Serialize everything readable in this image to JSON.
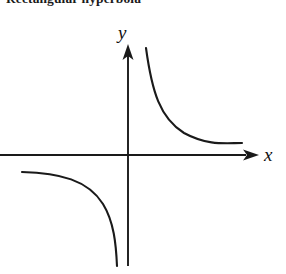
{
  "figure": {
    "caption": "Rectangular hyperbola",
    "background_color": "#ffffff",
    "stroke_color": "#1a1a1a",
    "width": 286,
    "height": 274
  },
  "axes": {
    "x_axis": {
      "label": "x",
      "label_style": "italic-serif",
      "origin_x": 128,
      "y": 155,
      "start_x": 0,
      "end_x": 258,
      "arrowhead": "right",
      "arrow_icon": "arrowhead-right-icon"
    },
    "y_axis": {
      "label": "y",
      "label_style": "italic-serif",
      "x": 128,
      "top_y": 45,
      "bottom_y": 266,
      "arrowhead": "up",
      "arrow_icon": "arrowhead-up-icon"
    }
  },
  "chart_data": {
    "type": "line",
    "title": "Rectangular hyperbola",
    "xlabel": "x",
    "ylabel": "y",
    "grid": false,
    "legend": "none",
    "equation": "y = k / x",
    "asymptotes": [
      "x = 0",
      "y = 0"
    ],
    "series": [
      {
        "name": "branch-quadrant-I",
        "quadrant": "I",
        "description": "Upper-right branch approaching the y-axis above and the x-axis to the right",
        "path": "M 146 48 C 152 92, 160 118, 184 133 C 208 146, 226 143, 242 143"
      },
      {
        "name": "branch-quadrant-III",
        "quadrant": "III",
        "description": "Lower-left branch approaching the x-axis to the left and the y-axis below",
        "path": "M 22 172 C 60 173, 88 180, 103 204 C 114 222, 116 244, 117 266"
      }
    ]
  }
}
